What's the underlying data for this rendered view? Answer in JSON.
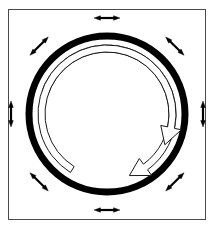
{
  "figure": {
    "title": "Rotating ring with radial expansion arrows",
    "type": "line-art-diagram",
    "canvas": {
      "width": 215,
      "height": 229,
      "background": "#ffffff"
    },
    "frame": {
      "name": "figure-border",
      "x": 8,
      "y": 9,
      "width": 198,
      "height": 211,
      "stroke": "#4a4a4a",
      "stroke_width": 1,
      "fill": "#ffffff"
    },
    "ring": {
      "name": "thick-black-ring",
      "center_x": 107,
      "center_y": 114,
      "radius": 78,
      "stroke": "#000000",
      "stroke_width": 7,
      "fill": "none"
    },
    "rotation_arrows": [
      {
        "name": "upper-rotation-arrow",
        "label": "clockwise rotation indicator (upper)",
        "center_x": 107,
        "center_y": 114,
        "inner_radius": 62,
        "outer_radius": 69,
        "start_angle_deg": 200,
        "end_angle_deg": 430,
        "direction": "clockwise",
        "stroke": "#1a1a1a",
        "stroke_width": 1,
        "fill": "#ffffff",
        "head_length_deg": 16,
        "head_spread": 7
      },
      {
        "name": "lower-rotation-arrow",
        "label": "clockwise rotation indicator (lower)",
        "center_x": 107,
        "center_y": 114,
        "inner_radius": 62,
        "outer_radius": 69,
        "start_angle_deg": 122,
        "end_angle_deg": 28,
        "direction": "clockwise",
        "stroke": "#1a1a1a",
        "stroke_width": 1,
        "fill": "#ffffff",
        "head_length_deg": 16,
        "head_spread": 7
      }
    ],
    "double_arrows": {
      "count": 8,
      "stroke": "#000000",
      "stroke_width": 2.2,
      "head_length": 6.5,
      "head_width": 4.6,
      "length": 26,
      "offset_from_center": 96,
      "orientation": "tangential",
      "items": [
        {
          "name": "double-arrow-top",
          "angle_deg": 270,
          "position": "top",
          "direction": "horizontal"
        },
        {
          "name": "double-arrow-top-right",
          "angle_deg": 315,
          "position": "top-right",
          "direction": "diagonal-ne-sw"
        },
        {
          "name": "double-arrow-right",
          "angle_deg": 0,
          "position": "right",
          "direction": "vertical"
        },
        {
          "name": "double-arrow-bottom-right",
          "angle_deg": 45,
          "position": "bottom-right",
          "direction": "diagonal-nw-se"
        },
        {
          "name": "double-arrow-bottom",
          "angle_deg": 90,
          "position": "bottom",
          "direction": "horizontal"
        },
        {
          "name": "double-arrow-bottom-left",
          "angle_deg": 135,
          "position": "bottom-left",
          "direction": "diagonal-ne-sw"
        },
        {
          "name": "double-arrow-left",
          "angle_deg": 180,
          "position": "left",
          "direction": "vertical"
        },
        {
          "name": "double-arrow-top-left",
          "angle_deg": 225,
          "position": "top-left",
          "direction": "diagonal-nw-se"
        }
      ]
    }
  }
}
